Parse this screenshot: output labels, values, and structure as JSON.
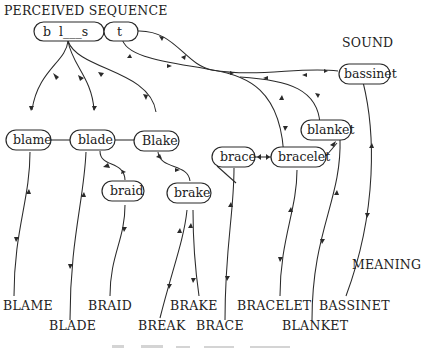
{
  "headings": {
    "perceived_sequence": "PERCEIVED SEQUENCE",
    "sound": "SOUND",
    "meaning": "MEANING"
  },
  "sequence_nodes": {
    "bls": "b  l___s",
    "t": "t"
  },
  "sound_nodes": {
    "blame": "blame",
    "blade": "blade",
    "blake": "Blake",
    "braid": "braid",
    "brake": "brake",
    "brace": "brace",
    "bracelet": "bracelet",
    "blanket": "blanket",
    "bassinet": "bassinet"
  },
  "meaning_words": {
    "blame": "BLAME",
    "blade": "BLADE",
    "braid": "BRAID",
    "break": "BREAK",
    "brake": "BRAKE",
    "brace": "BRACE",
    "bracelet": "BRACELET",
    "blanket": "BLANKET",
    "bassinet": "BASSINET"
  },
  "colors": {
    "ink": "#2a2a2a",
    "background": "#ffffff"
  }
}
